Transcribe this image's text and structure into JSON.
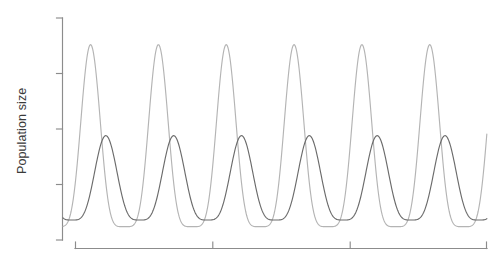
{
  "chart_data": {
    "type": "line",
    "title": "",
    "subtitle": "",
    "xlabel": "",
    "ylabel": "Population size",
    "grid": false,
    "legend": false,
    "legend_position": "none",
    "x_tick_labels": [],
    "y_tick_labels": [],
    "x_tick_count": 4,
    "y_tick_count": 5,
    "xlim": [
      0,
      100
    ],
    "ylim": [
      0,
      100
    ],
    "n_cycles": 6,
    "period": 16.0,
    "phase_lag": 3.6,
    "series": [
      {
        "name": "prey",
        "color": "#b4b4b4",
        "peak_value": 88,
        "trough_value": 6,
        "peak_x": [
          6.5,
          22.5,
          38.5,
          54.5,
          70.5,
          86.5
        ],
        "peak_sharpness": 2.6,
        "label": ""
      },
      {
        "name": "predator",
        "color": "#6b6b6b",
        "peak_value": 47,
        "trough_value": 9,
        "peak_x": [
          10.1,
          26.1,
          42.1,
          58.1,
          74.1,
          90.1
        ],
        "peak_sharpness": 2.0,
        "label": ""
      }
    ]
  },
  "axes": {
    "y_axis_label": "Population size",
    "y_axis_color": "#8c8c8c",
    "x_axis_color": "#8c8c8c"
  },
  "colors": {
    "background": "#ffffff",
    "prey_line": "#b4b4b4",
    "predator_line": "#6b6b6b",
    "axis": "#8c8c8c",
    "label_text": "#3a3a3a"
  }
}
